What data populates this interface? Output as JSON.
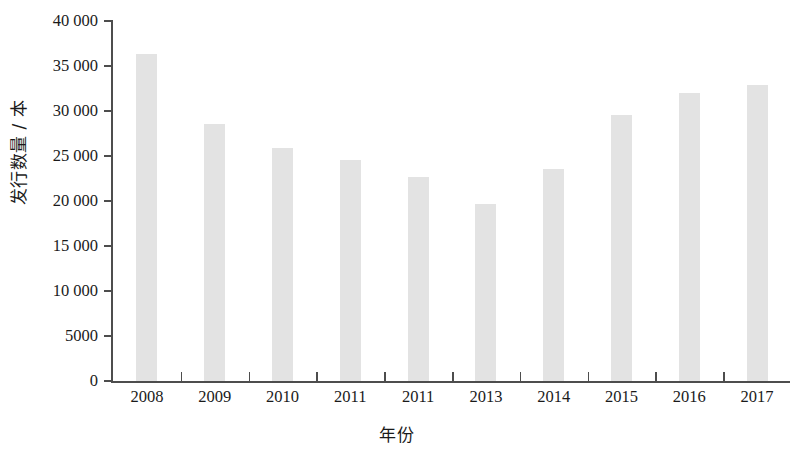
{
  "chart_data": {
    "type": "bar",
    "title": "",
    "subtitle": "",
    "xlabel": "年份",
    "ylabel": "发行数量 / 本",
    "categories": [
      "2008",
      "2009",
      "2010",
      "2011",
      "2011",
      "2013",
      "2014",
      "2015",
      "2016",
      "2017"
    ],
    "values": [
      36300,
      28600,
      25900,
      24600,
      22700,
      19700,
      23600,
      29600,
      32000,
      32900
    ],
    "series": [
      {
        "name": "发行数量",
        "values": [
          36300,
          28600,
          25900,
          24600,
          22700,
          19700,
          23600,
          29600,
          32000,
          32900
        ]
      }
    ],
    "ylim": [
      0,
      40000
    ],
    "ytick_values": [
      0,
      5000,
      10000,
      15000,
      20000,
      25000,
      30000,
      35000,
      40000
    ],
    "ytick_labels": [
      "0",
      "5000",
      "10 000",
      "15 000",
      "20 000",
      "25 000",
      "30 000",
      "35 000",
      "40 000"
    ],
    "grid": false,
    "legend": false,
    "legend_position": "none",
    "bar_color": "#e3e3e3",
    "axis_color": "#4d4d4d",
    "text_color": "#1a1a1a",
    "background_color": "#ffffff"
  }
}
